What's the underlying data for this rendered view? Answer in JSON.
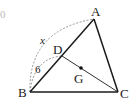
{
  "diagram": {
    "type": "triangle-geometry",
    "points": {
      "A": {
        "label": "A",
        "x": 94,
        "y": 19
      },
      "B": {
        "label": "B",
        "x": 30,
        "y": 92
      },
      "C": {
        "label": "C",
        "x": 118,
        "y": 92
      },
      "D": {
        "label": "D",
        "x": 62,
        "y": 56
      },
      "G": {
        "label": "G",
        "x": 81,
        "y": 68
      }
    },
    "segments": [
      "AB",
      "BC",
      "CA",
      "DC"
    ],
    "arcs": [
      {
        "from": "B",
        "to": "A",
        "label": "x",
        "style": "dashed"
      },
      {
        "from": "B",
        "to": "D",
        "label": "6",
        "style": "dashed"
      }
    ],
    "labels": {
      "A": "A",
      "B": "B",
      "C": "C",
      "D": "D",
      "G": "G",
      "x": "x",
      "six": "6",
      "corner": "0"
    },
    "colors": {
      "line": "#1a1a1a",
      "dashed": "#888888"
    }
  }
}
